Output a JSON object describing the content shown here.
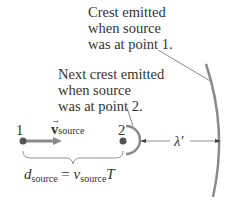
{
  "labels": {
    "crest1": [
      "Crest emitted",
      "when source",
      "was at point 1."
    ],
    "crest2": [
      "Next crest emitted",
      "when source",
      "was at point 2."
    ],
    "point1": "1",
    "point2": "2",
    "velocity": {
      "symbol": "v",
      "subscript": "source"
    },
    "wavelength": "λ′",
    "equation": {
      "lhs_symbol": "d",
      "lhs_sub": "source",
      "equals": "=",
      "rhs_symbol": "v",
      "rhs_sub": "source",
      "rhs_tail": "T"
    }
  },
  "colors": {
    "line": "#8a8a8a",
    "dot": "#555555",
    "text": "#333333",
    "arrow": "#7a7a7a"
  }
}
